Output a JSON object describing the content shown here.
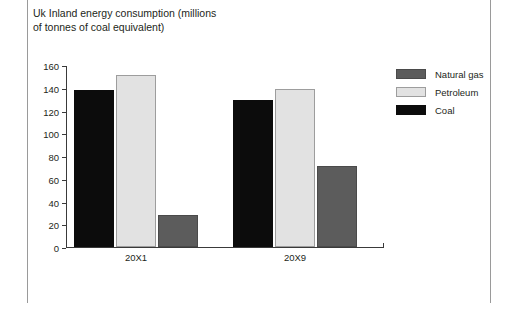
{
  "chart_data": {
    "type": "bar",
    "title": "Uk Inland energy consumption (millions of tonnes of coal equivalent)",
    "xlabel": "",
    "ylabel": "",
    "ylim": [
      0,
      160
    ],
    "ytick_step": 20,
    "yticks": [
      0,
      20,
      40,
      60,
      80,
      100,
      120,
      140,
      160
    ],
    "grid": false,
    "legend_position": "top-right",
    "categories": [
      "20X1",
      "20X9"
    ],
    "series": [
      {
        "name": "Coal",
        "color": "#0c0c0c",
        "values": [
          138,
          129
        ]
      },
      {
        "name": "Petroleum",
        "color": "#e2e2e2",
        "values": [
          151,
          139
        ]
      },
      {
        "name": "Natural gas",
        "color": "#5c5c5c",
        "values": [
          28,
          71
        ]
      }
    ],
    "legend_order": [
      "Natural gas",
      "Petroleum",
      "Coal"
    ]
  },
  "legend": {
    "items": [
      {
        "label": "Natural gas",
        "swatch": "naturalgas"
      },
      {
        "label": "Petroleum",
        "swatch": "petroleum"
      },
      {
        "label": "Coal",
        "swatch": "coal"
      }
    ]
  }
}
